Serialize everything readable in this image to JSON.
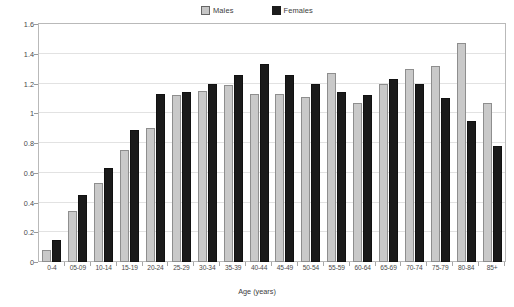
{
  "legend": {
    "position": "top-center",
    "entries": [
      {
        "label": "Males",
        "color": "#c9c9c9",
        "icon": "square-swatch-icon"
      },
      {
        "label": "Females",
        "color": "#1a1a1a",
        "icon": "square-swatch-icon"
      }
    ]
  },
  "axes": {
    "ylabel": "Estimated prevalence of diagnosed epilepsy in England (%)",
    "xlabel": "Age (years)",
    "yticks": [
      "0",
      "0.2",
      "0.4",
      "0.6",
      "0.8",
      "1",
      "1.2",
      "1.4",
      "1.6"
    ]
  },
  "chart_data": {
    "type": "bar",
    "title": "",
    "subtitle": "",
    "xlabel": "Age (years)",
    "ylabel": "Estimated prevalence of diagnosed epilepsy in England (%)",
    "ylim": [
      0,
      1.6
    ],
    "ytick_step": 0.2,
    "grid": true,
    "grid_axis": "y",
    "legend_position": "top-center",
    "categories": [
      "0-4",
      "05-09",
      "10-14",
      "15-19",
      "20-24",
      "25-29",
      "30-34",
      "35-39",
      "40-44",
      "45-49",
      "50-54",
      "55-59",
      "60-64",
      "65-69",
      "70-74",
      "75-79",
      "80-84",
      "85+"
    ],
    "series": [
      {
        "name": "Males",
        "color": "#c9c9c9",
        "values": [
          0.08,
          0.34,
          0.53,
          0.75,
          0.9,
          1.12,
          1.15,
          1.19,
          1.13,
          1.13,
          1.11,
          1.27,
          1.07,
          1.2,
          1.3,
          1.32,
          1.47,
          1.07
        ]
      },
      {
        "name": "Females",
        "color": "#1a1a1a",
        "values": [
          0.15,
          0.45,
          0.63,
          0.89,
          1.13,
          1.14,
          1.2,
          1.26,
          1.33,
          1.26,
          1.2,
          1.14,
          1.12,
          1.23,
          1.2,
          1.1,
          0.95,
          0.78
        ]
      }
    ]
  }
}
